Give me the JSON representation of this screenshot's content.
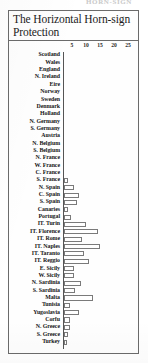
{
  "running_head": "HORN-SIGN",
  "figure": {
    "title": "The Horizontal Horn-sign Protection"
  },
  "chart_data": {
    "type": "bar",
    "orientation": "horizontal",
    "title": "The Horizontal Horn-sign Protection",
    "xlabel": "",
    "ylabel": "",
    "xlim": [
      0,
      32
    ],
    "grid": false,
    "legend": null,
    "tick_labels": [
      "5",
      "10",
      "15",
      "20",
      "25",
      "30"
    ],
    "ticks": [
      5,
      10,
      15,
      20,
      25,
      30
    ],
    "categories": [
      "Scotland",
      "Wales",
      "England",
      "N. Ireland",
      "Eire",
      "Norway",
      "Sweden",
      "Denmark",
      "Holland",
      "N. Germany",
      "S. Germany",
      "Austria",
      "N. Belgium",
      "S. Belgium",
      "N. France",
      "W. France",
      "C. France",
      "S. France",
      "N. Spain",
      "C. Spain",
      "S. Spain",
      "Canaries",
      "Portugal",
      "IT. Turin",
      "IT. Florence",
      "IT. Rome",
      "IT. Naples",
      "IT. Taranto",
      "IT. Reggio",
      "E. Sicily",
      "W. Sicily",
      "N. Sardinia",
      "S. Sardinia",
      "Malta",
      "Tunisia",
      "Yugoslavia",
      "Corfu",
      "N. Greece",
      "S. Greece",
      "Turkey"
    ],
    "values": [
      0,
      0,
      0,
      0,
      0,
      0,
      0,
      0,
      0,
      0,
      0,
      0,
      0,
      0,
      0,
      0,
      0,
      1.5,
      3.5,
      5.5,
      4.5,
      1.5,
      2.5,
      8,
      12,
      6.5,
      13,
      7,
      9,
      3.5,
      3.5,
      6,
      4,
      10.5,
      2,
      5.5,
      2,
      2,
      1.5,
      1
    ]
  }
}
